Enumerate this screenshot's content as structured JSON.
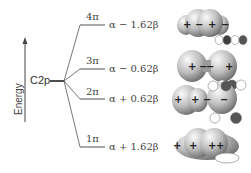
{
  "axis": {
    "label": "Energy",
    "direction": "up"
  },
  "atomic_level": {
    "label": "C2p"
  },
  "levels": [
    {
      "name": "4π",
      "energy": "α − 1.62β",
      "y": 25,
      "signs": [
        "+",
        "−",
        "+",
        "−"
      ]
    },
    {
      "name": "3π",
      "energy": "α − 0.62β",
      "y": 69,
      "signs": [
        "+",
        "−",
        "−",
        "+"
      ]
    },
    {
      "name": "2π",
      "energy": "α + 0.62β",
      "y": 99,
      "signs": [
        "+",
        "+",
        "−",
        "−"
      ]
    },
    {
      "name": "1π",
      "energy": "α + 1.62β",
      "y": 147,
      "signs": [
        "+",
        "+",
        "+",
        "+"
      ]
    }
  ],
  "colors": {
    "line": "#555555",
    "orbital_light": "#f2f2f2",
    "orbital_dark": "#6e6e6e",
    "lobe_dark": "#444444"
  }
}
